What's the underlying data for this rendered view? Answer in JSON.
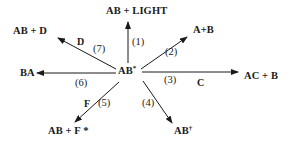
{
  "diagram": {
    "center": {
      "label": "AB",
      "superscript": "*"
    },
    "pathways": [
      {
        "step": "(1)",
        "product": "AB + LIGHT",
        "reagent": "",
        "direction": "up"
      },
      {
        "step": "(2)",
        "product": "A+B",
        "reagent": "",
        "direction": "up-right"
      },
      {
        "step": "(3)",
        "product": "AC + B",
        "reagent": "C",
        "direction": "right"
      },
      {
        "step": "(4)",
        "product": "AB",
        "product_superscript": "†",
        "reagent": "",
        "direction": "down-right"
      },
      {
        "step": "(5)",
        "product": "AB + F *",
        "reagent": "F",
        "direction": "down-left"
      },
      {
        "step": "(6)",
        "product": "BA",
        "reagent": "",
        "direction": "left"
      },
      {
        "step": "(7)",
        "product": "AB + D",
        "reagent": "D",
        "direction": "up-left"
      }
    ]
  }
}
